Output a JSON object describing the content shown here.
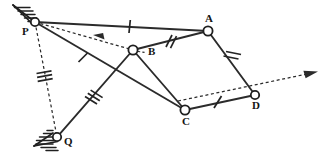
{
  "diagram": {
    "type": "kinematic-linkage-diagram",
    "canvas": {
      "width": 332,
      "height": 163,
      "background": "#ffffff"
    },
    "stroke_color": "#2b2b2b",
    "joint_fill": "#ffffff",
    "label_color": "#141414",
    "joints": [
      {
        "id": "P",
        "label": "P",
        "x": 35,
        "y": 22,
        "radius": 4.2,
        "grounded": true,
        "label_dx": -9,
        "label_dy": 6
      },
      {
        "id": "Q",
        "label": "Q",
        "x": 57,
        "y": 137,
        "radius": 4.2,
        "grounded": true,
        "label_dx": 6,
        "label_dy": 1
      },
      {
        "id": "A",
        "label": "A",
        "x": 208,
        "y": 31,
        "radius": 4.6,
        "grounded": false,
        "label_dx": -2,
        "label_dy": -15
      },
      {
        "id": "B",
        "label": "B",
        "x": 133,
        "y": 50,
        "radius": 4.6,
        "grounded": false,
        "label_dx": 14,
        "label_dy": 1
      },
      {
        "id": "C",
        "label": "C",
        "x": 185,
        "y": 110,
        "radius": 4.6,
        "grounded": false,
        "label_dx": -3,
        "label_dy": 7
      },
      {
        "id": "D",
        "label": "D",
        "x": 255,
        "y": 95,
        "radius": 4.2,
        "grounded": false,
        "label_dx": -3,
        "label_dy": 6
      }
    ],
    "links": [
      {
        "id": "PA",
        "from": "P",
        "to": "A",
        "style": "solid",
        "ticks": 1,
        "tick_t": 0.55
      },
      {
        "id": "PC",
        "from": "P",
        "to": "C",
        "style": "solid",
        "ticks": 1,
        "tick_t": 0.32
      },
      {
        "id": "QB",
        "from": "Q",
        "to": "B",
        "style": "solid",
        "ticks": 3,
        "tick_t": 0.5
      },
      {
        "id": "BA",
        "from": "B",
        "to": "A",
        "style": "solid",
        "ticks": 2,
        "tick_t": 0.5
      },
      {
        "id": "BC",
        "from": "B",
        "to": "C",
        "style": "solid",
        "ticks": 0,
        "tick_t": 0.5
      },
      {
        "id": "AD",
        "from": "A",
        "to": "D",
        "style": "solid",
        "ticks": 2,
        "tick_t": 0.5
      },
      {
        "id": "CD",
        "from": "C",
        "to": "D",
        "style": "solid",
        "ticks": 1,
        "tick_t": 0.46
      }
    ],
    "guides": [
      {
        "id": "PB-guide",
        "from": "P",
        "to": "B",
        "style": "dashed",
        "ticks": 0,
        "arrow_at": 0.58,
        "arrow_dir": "toward-from"
      },
      {
        "id": "PQ-guide",
        "from": "P",
        "to": "Q",
        "style": "dashed",
        "ticks": 3,
        "tick_t": 0.49,
        "arrow_at": null
      },
      {
        "id": "CD-extension-guide",
        "from": "C",
        "to": "D",
        "style": "dashed",
        "extend_to_x": 312,
        "ticks": 0,
        "arrow_at": 1.0,
        "arrow_dir": "toward-to"
      }
    ],
    "supports": [
      {
        "id": "support-P",
        "joint": "P",
        "kind": "fixed-ground-hatched",
        "orientation": "upper-left"
      },
      {
        "id": "support-Q",
        "joint": "Q",
        "kind": "fixed-ground-hatched",
        "orientation": "lower-left"
      }
    ],
    "labels": {
      "P": "P",
      "Q": "Q",
      "A": "A",
      "B": "B",
      "C": "C",
      "D": "D"
    }
  }
}
